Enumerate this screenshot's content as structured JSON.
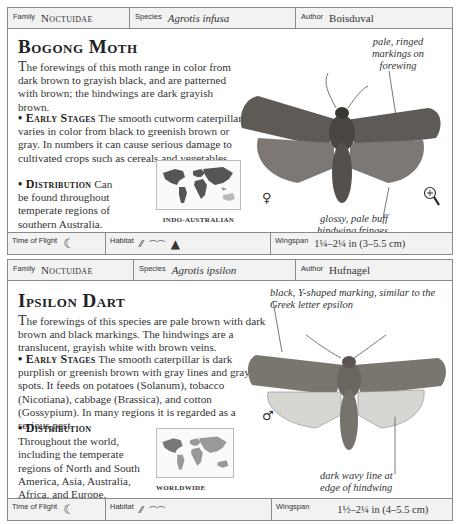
{
  "entries": [
    {
      "header": {
        "family_label": "Family",
        "family": "Noctuidae",
        "species_label": "Species",
        "species": "Agrotis infusa",
        "author_label": "Author",
        "author": "Boisduval"
      },
      "title": "Bogong Moth",
      "description": "he forewings of this moth range in color from dark brown to grayish black, and are patterned with brown; the hindwings are dark grayish brown.",
      "description_initial": "T",
      "early_stages_label": "• Early Stages",
      "early_stages": " The smooth cutworm caterpillar varies in color from black to greenish brown or gray. In numbers it can cause serious damage to cultivated crops such as cereals and vegetables.",
      "distribution_label": "• Distribution",
      "distribution": " Can be found throughout temperate regions of southern Australia.",
      "map_label": "INDO-AUSTRALIAN",
      "annotations": [
        "pale, ringed markings on forewing",
        "glossy, pale buff hindwing fringes"
      ],
      "sex_symbol": "♀",
      "magnifier_icon": "magnifier-plus-icon",
      "footer": {
        "time_of_flight_label": "Time of Flight",
        "time_of_flight_icon": "crescent-moon-icon",
        "habitat_label": "Habitat",
        "habitat_icons": [
          "farmland-icon",
          "grassland-icon",
          "mountain-icon"
        ],
        "wingspan_label": "Wingspan",
        "wingspan": "1¼–2¼ in (3–5.5 cm)"
      }
    },
    {
      "header": {
        "family_label": "Family",
        "family": "Noctuidae",
        "species_label": "Species",
        "species": "Agrotis ipsilon",
        "author_label": "Author",
        "author": "Hufnagel"
      },
      "title": "Ipsilon Dart",
      "description_initial": "T",
      "description": "he forewings of this species are pale brown with dark brown and black markings. The hindwings are a translucent, grayish white with brown veins.",
      "early_stages_label": "• Early Stages",
      "early_stages": " The smooth caterpillar is dark purplish or greenish brown with gray lines and gray spots. It feeds on potatoes (Solanum), tobacco (Nicotiana), cabbage (Brassica), and cotton (Gossypium). In many regions it is regarded as a serious pest.",
      "distribution_label": "• Distribution",
      "distribution": "Throughout the world, including the temperate regions of North and South America, Asia, Australia, Africa, and Europe.",
      "map_label": "WORLDWIDE",
      "annotations": [
        "black, Y-shaped marking, similar to the Greek letter epsilon",
        "dark wavy line at edge of hindwing"
      ],
      "sex_symbol": "♂",
      "footer": {
        "time_of_flight_label": "Time of Flight",
        "time_of_flight_icon": "crescent-moon-icon",
        "habitat_label": "Habitat",
        "habitat_icons": [
          "farmland-icon",
          "grassland-icon"
        ],
        "wingspan_label": "Wingspan",
        "wingspan": "1½–2¼ in (4–5.5 cm)"
      }
    }
  ]
}
